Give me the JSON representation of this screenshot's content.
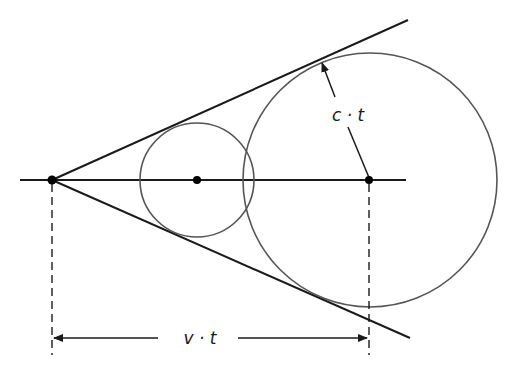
{
  "diagram": {
    "type": "geometric-construction",
    "colors": {
      "line": "#1a1a1a",
      "circle": "#555555",
      "background": "#ffffff"
    },
    "apex": {
      "x": 52,
      "y": 180
    },
    "axis": {
      "x1": 20,
      "x2": 406,
      "y": 180
    },
    "upper_tangent": {
      "x1": 52,
      "y1": 180,
      "x2": 408,
      "y2": 20
    },
    "lower_tangent": {
      "x1": 52,
      "y1": 180,
      "x2": 410,
      "y2": 338
    },
    "circles": [
      {
        "name": "small-circle",
        "cx": 197,
        "cy": 180,
        "r": 57
      },
      {
        "name": "large-circle",
        "cx": 370,
        "cy": 180,
        "r": 127
      }
    ],
    "points": [
      {
        "name": "apex-point",
        "x": 52,
        "y": 180
      },
      {
        "name": "small-center-point",
        "x": 197,
        "y": 180
      },
      {
        "name": "large-center-point",
        "x": 370,
        "y": 180
      }
    ],
    "radius_arrow": {
      "x1": 370,
      "y1": 180,
      "x2": 322,
      "y2": 62
    },
    "dimension": {
      "y": 338,
      "x1": 52,
      "x2": 370,
      "dash_top": 180,
      "dash_bottom": 355
    }
  },
  "labels": {
    "radius_label": "c · t",
    "distance_label": "v · t"
  }
}
